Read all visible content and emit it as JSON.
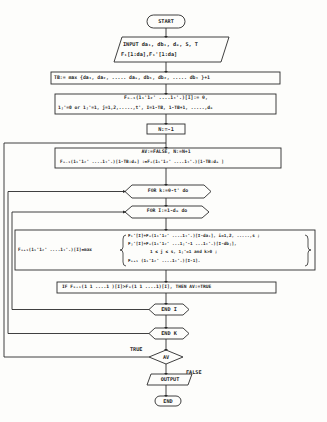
{
  "flowchart": {
    "start": "START",
    "input": {
      "line1": "INPUT da₁, db₁, dₘ, S, T",
      "line2": "F₁[1:da],F₁'[1:da]"
    },
    "tb": "TB:= max {da₁, da₂, ..... daₛ, db₁, db₂, ..... dbₜ }+1",
    "init": {
      "line1": "Fₙ₋₁(1₁'1₂' ....1ₜ'.)[I]:= 0,",
      "line2": "1ⱼ'=0 or 1ⱼ'=1, j=1,2,.....,t', I=1-TB, 1-TB+1, .....,dₘ"
    },
    "n_init": "N:=-1",
    "av_box": {
      "line1": "AV:=FALSE, N:=N+1",
      "line2": "Fₙ₋₁(1₁'1₂' ....1ₜ'.)[1-TB:dₘ] :=Fₙ(1₁'1₂' ....1ₜ'.)[1-TB:dₘ ]"
    },
    "for_k": "FOR k:=0-t' do",
    "for_i": "FOR I:=1-dₘ do",
    "formula": {
      "lhs": "Fₙ₊₁(1₁'1₂' ....1ₜ'.)[I]=max",
      "case1": "Fᵢ'[I]+Fₙ(1₁'1₂' ....1ₜ'.)[I-daᵢ], i=1,2, .....,s ;",
      "case2": "Fⱼ'[I]+Fₙ(1₁'1₂' ...1ⱼ'-1 ...1ₜ'.)[I-dbⱼ],",
      "case2b": "1 ≤ j ≤ s, 1ⱼ'=1 and k>0 ;",
      "case3": "Fₙ₊₁ (1₁'1₂' ....1ₜ'.)[I-1]."
    },
    "if_box": "IF Fₙ₊₁(1 1 ....1 )[I]>Fₙ(1 1 ....1)[I], THEN AV:=TRUE",
    "end_i": "END I",
    "end_k": "END K",
    "decision": "AV",
    "true_label": "TRUE",
    "false_label": "FALSE",
    "output": "OUTPUT",
    "end": "END"
  }
}
